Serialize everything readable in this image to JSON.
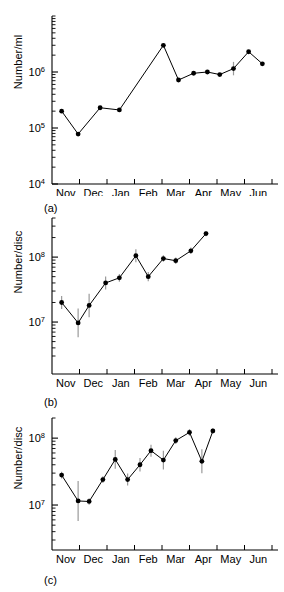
{
  "figure": {
    "background_color": "#ffffff",
    "line_color": "#000000",
    "marker_color": "#000000",
    "errorbar_color": "#9a9a9a"
  },
  "panels": [
    {
      "caption": "(a)",
      "ylabel": "Number/ml",
      "ytick_labels": [
        "10",
        "10",
        "10"
      ],
      "ytick_exponents": [
        "6",
        "5",
        "4"
      ]
    },
    {
      "caption": "(b)",
      "ylabel": "Number/disc",
      "ytick_labels": [
        "10",
        "10"
      ],
      "ytick_exponents": [
        "8",
        "7"
      ]
    },
    {
      "caption": "(c)",
      "ylabel": "Number/disc",
      "ytick_labels": [
        "10",
        "10"
      ],
      "ytick_exponents": [
        "8",
        "7"
      ]
    }
  ],
  "xaxis": {
    "tick_labels": [
      "Nov",
      "Dec",
      "Jan",
      "Feb",
      "Mar",
      "Apr",
      "May",
      "Jun"
    ]
  },
  "chart_data": [
    {
      "type": "line",
      "title": "(a)",
      "xlabel": "",
      "ylabel": "Number/ml",
      "yscale": "log",
      "ylim": [
        10000,
        10000000
      ],
      "ytick_values": [
        1000000,
        100000,
        10000
      ],
      "ytick_text": [
        "10^6",
        "10^5",
        "10^4"
      ],
      "xlim": [
        "Nov",
        "Jun"
      ],
      "xtick_labels": [
        "Nov",
        "Dec",
        "Jan",
        "Feb",
        "Mar",
        "Apr",
        "May",
        "Jun"
      ],
      "grid": false,
      "legend": "none",
      "x": [
        0.35,
        0.95,
        1.75,
        2.45,
        4.05,
        4.6,
        5.15,
        5.65,
        6.1,
        6.6,
        7.15,
        7.65
      ],
      "values": [
        200000,
        78000,
        230000,
        210000,
        3000000,
        720000,
        950000,
        1000000,
        900000,
        1150000,
        2300000,
        1400000
      ],
      "errors": [
        0,
        0,
        0,
        0,
        0,
        0,
        0,
        0,
        0,
        0.12,
        0,
        0
      ]
    },
    {
      "type": "line",
      "title": "(b)",
      "xlabel": "",
      "ylabel": "Number/disc",
      "yscale": "log",
      "ylim": [
        3000000,
        400000000
      ],
      "ytick_values": [
        100000000,
        10000000
      ],
      "ytick_text": [
        "10^8",
        "10^7"
      ],
      "xlim": [
        "Nov",
        "Jun"
      ],
      "xtick_labels": [
        "Nov",
        "Dec",
        "Jan",
        "Feb",
        "Mar",
        "Apr",
        "May",
        "Jun"
      ],
      "grid": false,
      "legend": "none",
      "x": [
        0.35,
        0.95,
        1.35,
        1.95,
        2.45,
        3.05,
        3.5,
        4.05,
        4.5,
        5.05,
        5.6
      ],
      "values": [
        20000000,
        9700000,
        18000000,
        40000000,
        48000000,
        105000000,
        50000000,
        95000000,
        88000000,
        125000000,
        230000000
      ],
      "errors": [
        0.1,
        0.22,
        0.18,
        0.1,
        0.06,
        0.1,
        0.07,
        0.05,
        0.05,
        0.05,
        0.04
      ]
    },
    {
      "type": "line",
      "title": "(c)",
      "xlabel": "",
      "ylabel": "Number/disc",
      "yscale": "log",
      "ylim": [
        3000000,
        200000000
      ],
      "ytick_values": [
        100000000,
        10000000
      ],
      "ytick_text": [
        "10^8",
        "10^7"
      ],
      "xlim": [
        "Nov",
        "Jun"
      ],
      "xtick_labels": [
        "Nov",
        "Dec",
        "Jan",
        "Feb",
        "Mar",
        "Apr",
        "May",
        "Jun"
      ],
      "grid": false,
      "legend": "none",
      "x": [
        0.35,
        0.95,
        1.35,
        1.85,
        2.3,
        2.75,
        3.2,
        3.6,
        4.05,
        4.5,
        5.0,
        5.45,
        5.85
      ],
      "values": [
        28000000,
        11500000,
        11300000,
        24000000,
        48000000,
        24000000,
        40000000,
        65000000,
        47000000,
        92000000,
        122000000,
        45000000,
        128000000
      ],
      "errors": [
        0.05,
        0.3,
        0.05,
        0.05,
        0.14,
        0.09,
        0.1,
        0.09,
        0.14,
        0.05,
        0.05,
        0.18,
        0.04
      ]
    }
  ]
}
